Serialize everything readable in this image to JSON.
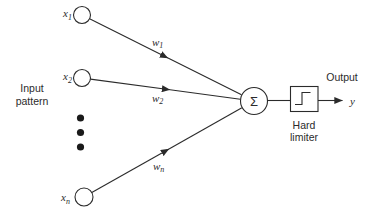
{
  "diagram": {
    "title_semantic": "single-layer perceptron with hard limiter",
    "input_group_label": {
      "line1": "Input",
      "line2": "pattern"
    },
    "inputs": [
      {
        "base": "x",
        "sub": "1"
      },
      {
        "base": "x",
        "sub": "2"
      },
      {
        "base": "x",
        "sub": "n"
      }
    ],
    "weights": [
      {
        "base": "w",
        "sub": "1"
      },
      {
        "base": "w",
        "sub": "2"
      },
      {
        "base": "w",
        "sub": "n"
      }
    ],
    "sum_symbol": "Σ",
    "hard_limiter_label": {
      "line1": "Hard",
      "line2": "limiter"
    },
    "output_label": "Output",
    "output_var": "y",
    "colors": {
      "line": "#2b2b2b",
      "background": "#ffffff"
    }
  }
}
